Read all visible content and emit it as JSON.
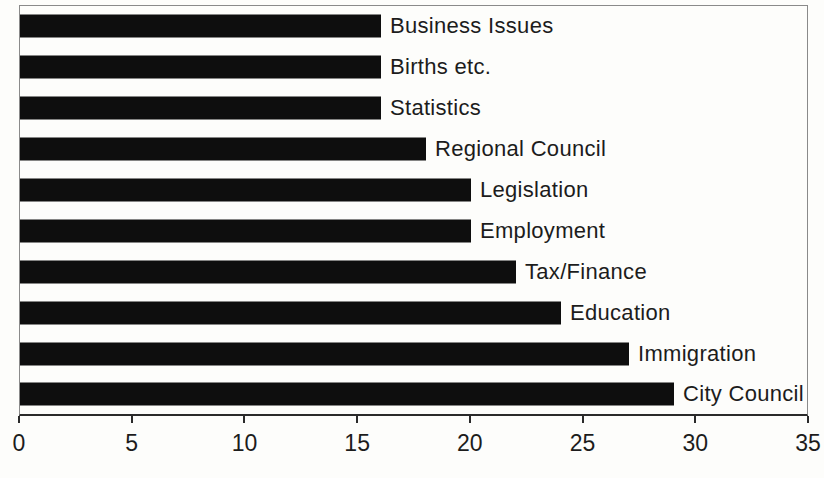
{
  "chart_data": {
    "type": "bar",
    "orientation": "horizontal",
    "title": "",
    "categories": [
      "Business Issues",
      "Births etc.",
      "Statistics",
      "Regional Council",
      "Legislation",
      "Employment",
      "Tax/Finance",
      "Education",
      "Immigration",
      "City Council"
    ],
    "values": [
      16,
      16,
      16,
      18,
      20,
      20,
      22,
      24,
      27,
      29
    ],
    "xlabel": "",
    "ylabel": "",
    "xlim": [
      0,
      35
    ],
    "xticks": [
      0,
      5,
      10,
      15,
      20,
      25,
      30,
      35
    ],
    "grid": false,
    "legend": "none",
    "category_label_position": "right-of-bar",
    "colors": {
      "bar": "#0e0e0e",
      "text": "#1c1c1c",
      "plot_border": "#8a8a8a",
      "axis": "#2a2a2a",
      "background": "#fdfdfb"
    }
  }
}
